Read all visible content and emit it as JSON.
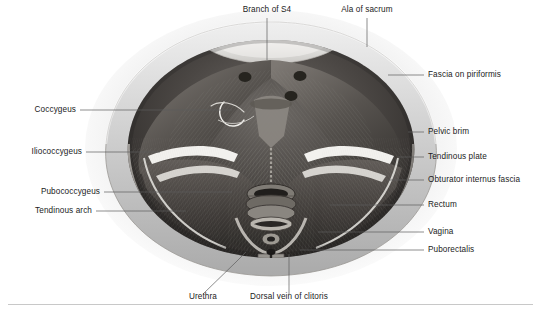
{
  "figure": {
    "kind": "anatomical-illustration",
    "background_color": "#ffffff",
    "rule_color": "#c8c8c8",
    "leader_color": "#5b5b5b",
    "text_color": "#1b1b1b"
  },
  "labels": {
    "top": [
      {
        "id": "branch-of-s4",
        "text": "Branch of S4"
      },
      {
        "id": "ala-of-sacrum",
        "text": "Ala of sacrum"
      }
    ],
    "left": [
      {
        "id": "coccygeus",
        "text": "Coccygeus"
      },
      {
        "id": "iliococcygeus",
        "text": "Iliococcygeus"
      },
      {
        "id": "pubococcygeus",
        "text": "Pubococcygeus"
      },
      {
        "id": "tendinous-arch",
        "text": "Tendinous arch"
      }
    ],
    "right": [
      {
        "id": "fascia-on-piriformis",
        "text": "Fascia on piriformis"
      },
      {
        "id": "pelvic-brim",
        "text": "Pelvic brim"
      },
      {
        "id": "tendinous-plate",
        "text": "Tendinous plate"
      },
      {
        "id": "obturator-internus-fascia",
        "text": "Obturator internus fascia"
      },
      {
        "id": "rectum",
        "text": "Rectum"
      },
      {
        "id": "vagina",
        "text": "Vagina"
      },
      {
        "id": "puborectalis",
        "text": "Puborectalis"
      }
    ],
    "bottom": [
      {
        "id": "urethra",
        "text": "Urethra"
      },
      {
        "id": "dorsal-vein-of-clitoris",
        "text": "Dorsal vein of clitoris"
      }
    ]
  }
}
